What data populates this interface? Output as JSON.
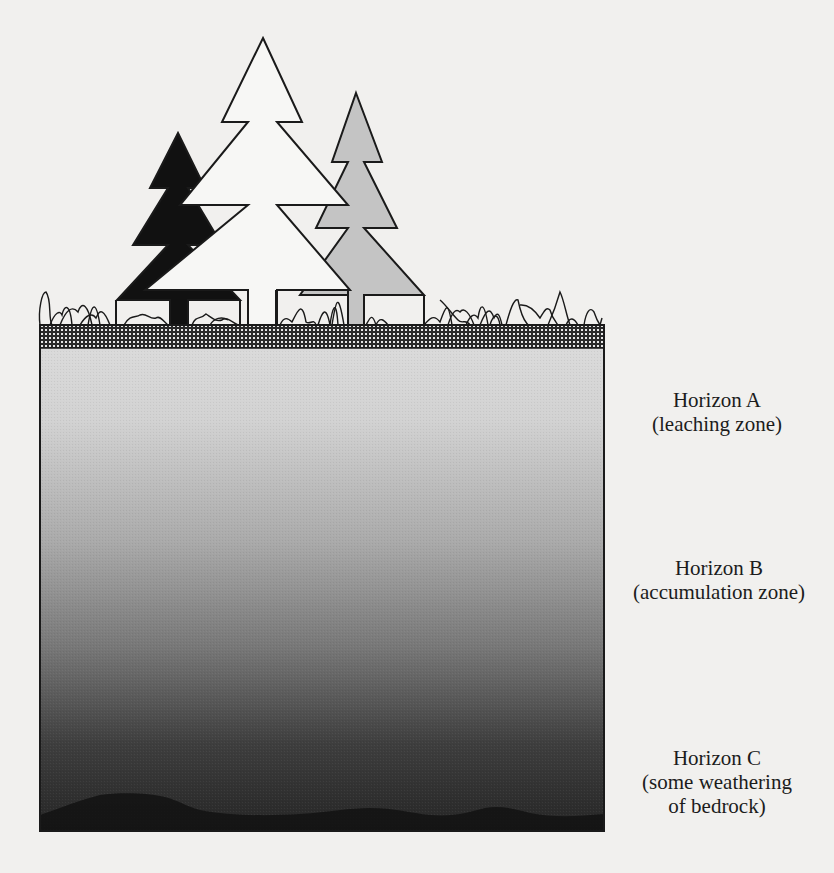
{
  "figure": {
    "type": "soil-profile-diagram",
    "colors": {
      "background": "#f1f0ee",
      "outline": "#1a1a1a",
      "tree_black": "#111111",
      "tree_white": "#f7f7f5",
      "tree_grey": "#c4c4c4",
      "topsoil_band": "#3a3a3a",
      "horizon_a": "#d6d6d6",
      "horizon_b": "#9a9a9a",
      "horizon_c": "#2e2e2e",
      "bedrock": "#141414"
    }
  },
  "horizons": [
    {
      "id": "A",
      "title": "Horizon A",
      "subtitle": "(leaching zone)"
    },
    {
      "id": "B",
      "title": "Horizon B",
      "subtitle": "(accumulation zone)"
    },
    {
      "id": "C",
      "title": "Horizon C",
      "subtitle_line1": "(some weathering",
      "subtitle_line2": "of bedrock)"
    }
  ]
}
